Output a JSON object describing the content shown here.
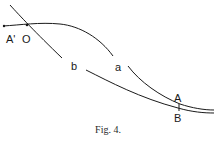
{
  "figure": {
    "caption": "Fig. 4.",
    "labels": {
      "A_prime": "A'",
      "O": "O",
      "a": "a",
      "b": "b",
      "A": "A",
      "B": "B"
    },
    "stroke_color": "#1a1a1a",
    "background": "#ffffff"
  }
}
